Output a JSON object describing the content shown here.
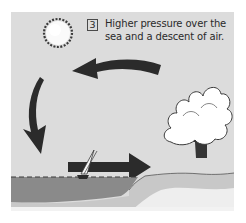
{
  "diagram": {
    "type": "sea-breeze-circulation",
    "step_number": "3",
    "caption_line1": "Higher pressure over the",
    "caption_line2": "sea and a descent of air.",
    "elements": [
      {
        "name": "sun",
        "description": "sun with jagged rays, upper left"
      },
      {
        "name": "top-arrow",
        "direction": "left",
        "description": "curved arrow moving from land toward sea aloft"
      },
      {
        "name": "descending-arrow",
        "direction": "down",
        "description": "curved arrow descending over the sea"
      },
      {
        "name": "surface-arrow",
        "direction": "right",
        "description": "straight arrow from sea toward land near surface"
      },
      {
        "name": "rising-arrow",
        "direction": "up",
        "description": "arrow rising over land into cloud"
      },
      {
        "name": "cumulus-cloud",
        "description": "cumulus cloud over land"
      },
      {
        "name": "sailboat",
        "description": "small sailboat on the sea"
      },
      {
        "name": "sea",
        "description": "dark grey sea on the left"
      },
      {
        "name": "land",
        "description": "light grey land on the right"
      }
    ],
    "colors": {
      "sky": "#dcdcdc",
      "arrow": "#2b2b2b",
      "sea": "#8c8c8c",
      "land": "#c4c4c4",
      "cloud": "#ffffff"
    }
  }
}
